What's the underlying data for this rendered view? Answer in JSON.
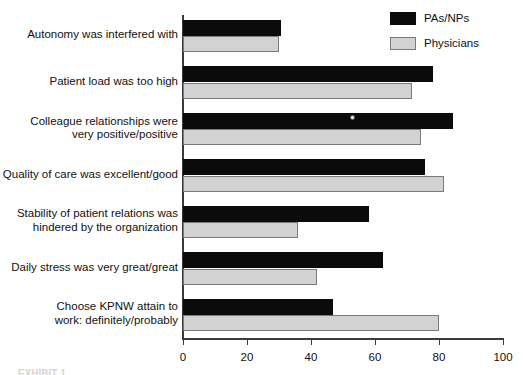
{
  "chart_data": {
    "type": "bar",
    "orientation": "horizontal",
    "title": "",
    "xlabel": "",
    "ylabel": "",
    "xlim": [
      0,
      100
    ],
    "xticks": [
      0,
      20,
      40,
      60,
      80,
      100
    ],
    "xtick_labels": [
      "0",
      "20",
      "40",
      "60",
      "80",
      "100"
    ],
    "grid": false,
    "legend_position": "top-right",
    "categories": [
      "Autonomy was interfered with",
      "Patient load was too high",
      "Colleague relationships were very positive/positive",
      "Quality of care was excellent/good",
      "Stability of patient relations was hindered by the organization",
      "Daily stress was very great/great",
      "Choose KPNW attain to work: definitely/probably"
    ],
    "series": [
      {
        "name": "PAs/NPs",
        "color": "#0b0b0b",
        "values": [
          30.5,
          78,
          84.5,
          75.5,
          58,
          62.5,
          47
        ]
      },
      {
        "name": "Physicians",
        "color": "#d2d2d2",
        "values": [
          30,
          71.5,
          74.5,
          81.5,
          36,
          42,
          80
        ]
      }
    ]
  },
  "legend": {
    "items": [
      {
        "label": "PAs/NPs",
        "swatch": "series-dark"
      },
      {
        "label": "Physicians",
        "swatch": "series-light"
      }
    ]
  },
  "category_labels": [
    {
      "lines": [
        "Autonomy was interfered with"
      ]
    },
    {
      "lines": [
        "Patient load was too high"
      ]
    },
    {
      "lines": [
        "Colleague relationships were",
        "very positive/positive"
      ]
    },
    {
      "lines": [
        "Quality of care was excellent/good"
      ]
    },
    {
      "lines": [
        "Stability of patient relations was",
        "hindered by the organization"
      ]
    },
    {
      "lines": [
        "Daily stress was very great/great"
      ]
    },
    {
      "lines": [
        "Choose KPNW attain to",
        "work: definitely/probably"
      ]
    }
  ],
  "axis": {
    "tick_labels": [
      "0",
      "20",
      "40",
      "60",
      "80",
      "100"
    ]
  },
  "caption": {
    "clipped_text": "EXHIBIT 1"
  },
  "colors": {
    "series_dark": "#0b0b0b",
    "series_light": "#d2d2d2",
    "axis": "#3a3a3a",
    "background": "#ffffff",
    "text": "#111111"
  }
}
